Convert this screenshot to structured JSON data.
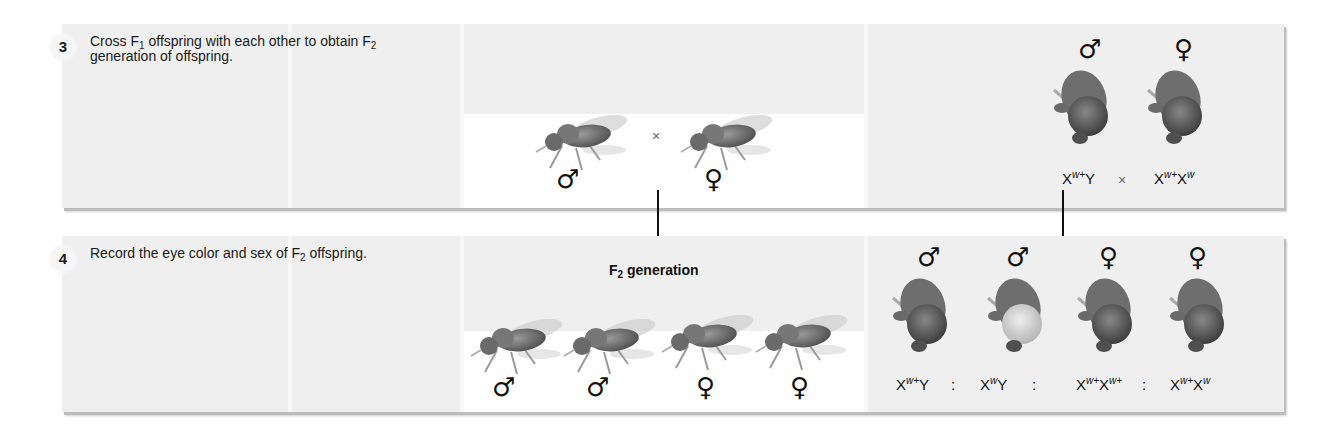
{
  "figure": {
    "steps": [
      {
        "number": "3",
        "text_parts": [
          "Cross F",
          "1",
          " offspring with each other to obtain F",
          "2",
          " generation of offspring."
        ],
        "cross": {
          "symbol": "×",
          "left_panel": {
            "flies": [
              {
                "sex": "♂",
                "sex_name": "male"
              },
              {
                "sex": "♀",
                "sex_name": "female"
              }
            ]
          },
          "right_panel": {
            "flies": [
              {
                "sex": "♂",
                "sex_name": "male",
                "genotype_base1": "X",
                "genotype_sup1": "w+",
                "genotype_base2": "Y",
                "genotype_sup2": "",
                "eye": "red"
              },
              {
                "sex": "♀",
                "sex_name": "female",
                "genotype_base1": "X",
                "genotype_sup1": "w+",
                "genotype_base2": "X",
                "genotype_sup2": "w",
                "eye": "red"
              }
            ]
          }
        }
      },
      {
        "number": "4",
        "text_parts": [
          "Record the eye color and sex of F",
          "2",
          " offspring."
        ],
        "generation_label_base": "F",
        "generation_label_sub": "2",
        "generation_label_rest": " generation",
        "ratio_separator": ":",
        "left_panel": {
          "flies": [
            {
              "sex": "♂",
              "sex_name": "male"
            },
            {
              "sex": "♂",
              "sex_name": "male"
            },
            {
              "sex": "♀",
              "sex_name": "female"
            },
            {
              "sex": "♀",
              "sex_name": "female"
            }
          ]
        },
        "right_panel": {
          "flies": [
            {
              "sex": "♂",
              "sex_name": "male",
              "genotype_base1": "X",
              "genotype_sup1": "w+",
              "genotype_base2": "Y",
              "genotype_sup2": "",
              "eye": "red"
            },
            {
              "sex": "♂",
              "sex_name": "male",
              "genotype_base1": "X",
              "genotype_sup1": "w",
              "genotype_base2": "Y",
              "genotype_sup2": "",
              "eye": "white"
            },
            {
              "sex": "♀",
              "sex_name": "female",
              "genotype_base1": "X",
              "genotype_sup1": "w+",
              "genotype_base2": "X",
              "genotype_sup2": "w+",
              "eye": "red"
            },
            {
              "sex": "♀",
              "sex_name": "female",
              "genotype_base1": "X",
              "genotype_sup1": "w+",
              "genotype_base2": "X",
              "genotype_sup2": "w",
              "eye": "red"
            }
          ]
        }
      }
    ],
    "colors": {
      "panel_bg": "#efefef",
      "strip_bg": "#ffffff",
      "text": "#1a1a1a",
      "eye_red": "#5a5a5a",
      "eye_white": "#d8d8d8"
    }
  }
}
